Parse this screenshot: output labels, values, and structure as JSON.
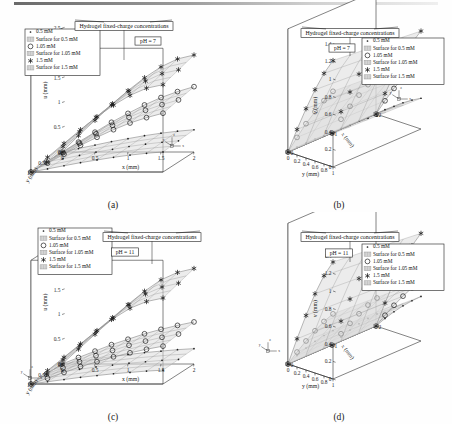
{
  "figure": {
    "title_box": "Hydrogel fixed-charge concentrations",
    "legend": {
      "items": [
        {
          "marker": "dot-marker",
          "label": "0.5 mM"
        },
        {
          "marker": "surface-swatch",
          "label": "Surface for 0.5 mM"
        },
        {
          "marker": "circle-marker",
          "label": "1.05 mM"
        },
        {
          "marker": "surface-swatch",
          "label": "Surface for 1.05 mM"
        },
        {
          "marker": "asterisk-marker",
          "label": "1.5 mM"
        },
        {
          "marker": "surface-swatch",
          "label": "Surface for 1.5 mM"
        }
      ]
    },
    "triad": {
      "x": "x",
      "y": "y",
      "z": "z"
    },
    "colors": {
      "line": "#1d1d1d",
      "surface_fill": "#d9d9d9",
      "mesh": "#7a7a7a",
      "background": "#ffffff"
    }
  },
  "panels": [
    {
      "id": "a",
      "caption": "(a)",
      "ph_label": "pH = 7",
      "legend_position": "top-left",
      "title_position": "top-center",
      "triad_position": "bottom-right"
    },
    {
      "id": "b",
      "caption": "(b)",
      "ph_label": "pH = 7",
      "legend_position": "top-right",
      "title_position": "top-center",
      "triad_position": "mid-right"
    },
    {
      "id": "c",
      "caption": "(c)",
      "ph_label": "pH = 11",
      "legend_position": "top-left",
      "title_position": "top-right",
      "triad_position": "bottom-left"
    },
    {
      "id": "d",
      "caption": "(d)",
      "ph_label": "pH = 11",
      "legend_position": "top-right",
      "title_position": "top-center",
      "triad_position": "bottom-left"
    }
  ],
  "chart_data": [
    {
      "panel": "a",
      "type": "surface",
      "title": "Hydrogel fixed-charge concentrations",
      "annotation": "pH = 7",
      "xlabel": "x (mm)",
      "ylabel": "y (mm)",
      "zlabel": "u (mm)",
      "xlim": [
        0,
        2
      ],
      "ylim": [
        0,
        1
      ],
      "zlim": [
        0,
        2.5
      ],
      "xticks": [
        0,
        0.5,
        1,
        1.5,
        2
      ],
      "yticks": [
        0,
        0.5,
        1
      ],
      "zticks": [
        0,
        0.5,
        1,
        1.5,
        2,
        2.5
      ],
      "y_axis_reversed": true,
      "grid": true,
      "series": [
        {
          "name": "0.5 mM",
          "marker": "dot",
          "x": [
            0,
            0.25,
            0.5,
            0.75,
            1.0,
            1.25,
            1.5,
            1.75,
            2.0
          ],
          "values": [
            0,
            0.07,
            0.14,
            0.21,
            0.27,
            0.33,
            0.38,
            0.42,
            0.45
          ]
        },
        {
          "name": "1.05 mM",
          "marker": "circle",
          "x": [
            0,
            0.25,
            0.5,
            0.75,
            1.0,
            1.25,
            1.5,
            1.75,
            2.0
          ],
          "values": [
            0,
            0.2,
            0.4,
            0.6,
            0.78,
            0.95,
            1.1,
            1.22,
            1.32
          ]
        },
        {
          "name": "1.5 mM",
          "marker": "asterisk",
          "x": [
            0,
            0.25,
            0.5,
            0.75,
            1.0,
            1.25,
            1.5,
            1.75,
            2.0
          ],
          "values": [
            0,
            0.33,
            0.64,
            0.95,
            1.24,
            1.5,
            1.72,
            1.88,
            1.96
          ]
        }
      ]
    },
    {
      "panel": "b",
      "type": "surface",
      "title": "Hydrogel fixed-charge concentrations",
      "annotation": "pH = 7",
      "xlabel": "x (mm)",
      "ylabel": "y (mm)",
      "zlabel": "v (mm)",
      "xlim": [
        0,
        2
      ],
      "ylim": [
        0,
        1
      ],
      "zlim": [
        0,
        1.4
      ],
      "xticks": [
        0,
        1,
        2
      ],
      "yticks": [
        0,
        0.2,
        0.4,
        0.6,
        0.8,
        1
      ],
      "zticks": [
        0,
        0.2,
        0.4,
        0.6,
        0.8,
        1,
        1.2,
        1.4
      ],
      "y_axis_reversed": true,
      "grid": true,
      "series": [
        {
          "name": "0.5 mM",
          "marker": "dot",
          "y": [
            0,
            0.2,
            0.4,
            0.6,
            0.8,
            1.0
          ],
          "values": [
            0,
            0.09,
            0.17,
            0.25,
            0.32,
            0.38
          ]
        },
        {
          "name": "1.05 mM",
          "marker": "circle",
          "y": [
            0,
            0.2,
            0.4,
            0.6,
            0.8,
            1.0
          ],
          "values": [
            0,
            0.2,
            0.39,
            0.56,
            0.72,
            0.86
          ]
        },
        {
          "name": "1.5 mM",
          "marker": "asterisk",
          "y": [
            0,
            0.2,
            0.4,
            0.6,
            0.8,
            1.0
          ],
          "values": [
            0,
            0.29,
            0.56,
            0.81,
            1.03,
            1.21
          ]
        }
      ]
    },
    {
      "panel": "c",
      "type": "surface",
      "title": "Hydrogel fixed-charge concentrations",
      "annotation": "pH = 11",
      "xlabel": "x (mm)",
      "ylabel": "y (mm)",
      "zlabel": "u (mm)",
      "xlim": [
        0,
        2
      ],
      "ylim": [
        0,
        1
      ],
      "zlim": [
        0,
        2.5
      ],
      "xticks": [
        0,
        0.5,
        1,
        1.5,
        2
      ],
      "yticks": [
        0,
        0.5,
        1
      ],
      "zticks": [
        0,
        0.5,
        1,
        1.5,
        2,
        2.5
      ],
      "y_axis_reversed": true,
      "grid": true,
      "series": [
        {
          "name": "0.5 mM",
          "marker": "dot",
          "x": [
            0,
            0.25,
            0.5,
            0.75,
            1.0,
            1.25,
            1.5,
            1.75,
            2.0
          ],
          "values": [
            0,
            0.05,
            0.1,
            0.15,
            0.19,
            0.23,
            0.26,
            0.29,
            0.31
          ]
        },
        {
          "name": "1.05 mM",
          "marker": "circle",
          "x": [
            0,
            0.25,
            0.5,
            0.75,
            1.0,
            1.25,
            1.5,
            1.75,
            2.0
          ],
          "values": [
            0,
            0.13,
            0.26,
            0.39,
            0.5,
            0.61,
            0.7,
            0.78,
            0.85
          ]
        },
        {
          "name": "1.5 mM",
          "marker": "asterisk",
          "x": [
            0,
            0.25,
            0.5,
            0.75,
            1.0,
            1.25,
            1.5,
            1.75,
            2.0
          ],
          "values": [
            0,
            0.3,
            0.6,
            0.9,
            1.2,
            1.47,
            1.7,
            1.85,
            1.93
          ]
        }
      ]
    },
    {
      "panel": "d",
      "type": "surface",
      "title": "Hydrogel fixed-charge concentrations",
      "annotation": "pH = 11",
      "xlabel": "x (mm)",
      "ylabel": "y (mm)",
      "zlabel": "v (mm)",
      "xlim": [
        0,
        2
      ],
      "ylim": [
        0,
        1
      ],
      "zlim": [
        0,
        1.6
      ],
      "xticks": [
        0,
        1,
        2
      ],
      "yticks": [
        0,
        0.2,
        0.4,
        0.6,
        0.8,
        1
      ],
      "zticks": [
        0,
        0.2,
        0.4,
        0.6,
        0.8,
        1,
        1.2,
        1.4,
        1.6
      ],
      "y_axis_reversed": true,
      "grid": true,
      "series": [
        {
          "name": "0.5 mM",
          "marker": "dot",
          "y": [
            0,
            0.2,
            0.4,
            0.6,
            0.8,
            1.0
          ],
          "values": [
            0,
            0.13,
            0.25,
            0.36,
            0.46,
            0.55
          ]
        },
        {
          "name": "1.05 mM",
          "marker": "circle",
          "y": [
            0,
            0.2,
            0.4,
            0.6,
            0.8,
            1.0
          ],
          "values": [
            0,
            0.17,
            0.33,
            0.48,
            0.62,
            0.74
          ]
        },
        {
          "name": "1.5 mM",
          "marker": "asterisk",
          "y": [
            0,
            0.2,
            0.4,
            0.6,
            0.8,
            1.0
          ],
          "values": [
            0,
            0.32,
            0.62,
            0.9,
            1.14,
            1.33
          ]
        }
      ]
    }
  ]
}
